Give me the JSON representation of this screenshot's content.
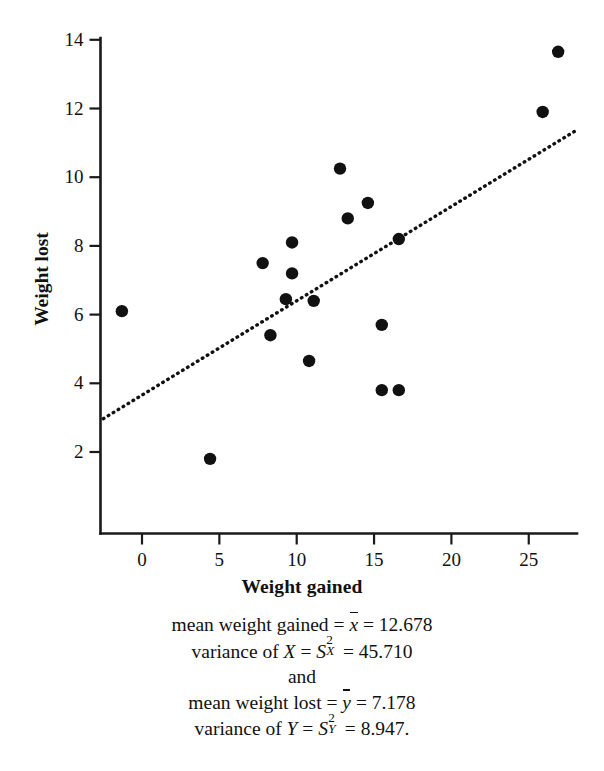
{
  "chart_data": {
    "type": "scatter",
    "title": "",
    "xlabel": "Weight gained",
    "ylabel": "Weight lost",
    "xlim": [
      -3.3,
      29.8
    ],
    "ylim": [
      1.0,
      14.6
    ],
    "xticks": [
      0,
      5,
      10,
      15,
      20,
      25
    ],
    "yticks": [
      2,
      4,
      6,
      8,
      10,
      12,
      14
    ],
    "grid": false,
    "legend": null,
    "points": [
      {
        "x": -1.3,
        "y": 6.1
      },
      {
        "x": 4.4,
        "y": 1.8
      },
      {
        "x": 7.8,
        "y": 7.5
      },
      {
        "x": 8.3,
        "y": 5.4
      },
      {
        "x": 9.3,
        "y": 6.45
      },
      {
        "x": 9.7,
        "y": 8.1
      },
      {
        "x": 9.7,
        "y": 7.2
      },
      {
        "x": 10.8,
        "y": 4.65
      },
      {
        "x": 11.1,
        "y": 6.4
      },
      {
        "x": 12.8,
        "y": 10.25
      },
      {
        "x": 13.3,
        "y": 8.8
      },
      {
        "x": 14.6,
        "y": 9.25
      },
      {
        "x": 15.5,
        "y": 5.7
      },
      {
        "x": 15.5,
        "y": 3.8
      },
      {
        "x": 16.6,
        "y": 3.8
      },
      {
        "x": 16.6,
        "y": 8.2
      },
      {
        "x": 25.9,
        "y": 11.9
      },
      {
        "x": 26.9,
        "y": 13.65
      }
    ],
    "fit_line": {
      "style": "dotted",
      "x0": -2.5,
      "y0": 2.97,
      "x1": 28.2,
      "y1": 11.4
    }
  },
  "axes": {
    "x_title": "Weight gained",
    "y_title": "Weight lost",
    "x_tick_labels": [
      "0",
      "5",
      "10",
      "15",
      "20",
      "25"
    ],
    "y_tick_labels": [
      "2",
      "4",
      "6",
      "8",
      "10",
      "12",
      "14"
    ]
  },
  "caption": {
    "line1_pre": "mean weight gained = ",
    "line1_sym": "x",
    "line1_post": " = 12.678",
    "line2_pre": "variance of ",
    "line2_var": "X",
    "line2_mid": " = ",
    "line2_sym": "S",
    "line2_sup": "2",
    "line2_sub": "X",
    "line2_post": " = 45.710",
    "line3": "and",
    "line4_pre": "mean weight lost = ",
    "line4_sym": "y",
    "line4_post": " = 7.178",
    "line5_pre": "variance of ",
    "line5_var": "Y",
    "line5_mid": " = ",
    "line5_sym": "S",
    "line5_sup": "2",
    "line5_sub": "Y",
    "line5_post": " = 8.947."
  },
  "style": {
    "point_color": "#111111",
    "axis_color": "#1a1a1a",
    "background": "#ffffff"
  }
}
